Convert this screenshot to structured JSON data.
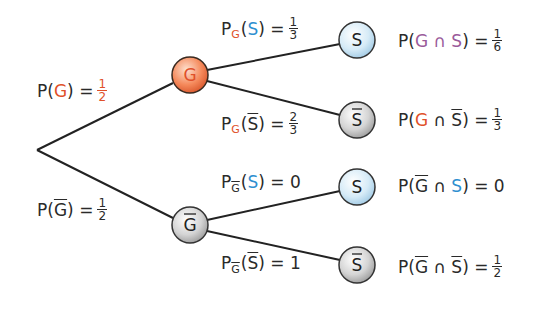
{
  "colors": {
    "g_accent": "#e0502a",
    "s_accent": "#2f8fd0",
    "intersection_accent": "#9a5a9a",
    "g_node_fill": "#f58a5c",
    "s_node_fill": "#cfe6f5",
    "neg_node_fill": "#cfcfcf",
    "line": "#222222"
  },
  "root": {
    "x": 37,
    "y": 150
  },
  "nodes": [
    {
      "id": "G",
      "label": "G",
      "negated": false,
      "x": 190,
      "y": 75,
      "style": "g"
    },
    {
      "id": "notG",
      "label": "G",
      "negated": true,
      "x": 190,
      "y": 225,
      "style": "neg"
    },
    {
      "id": "G_S",
      "label": "S",
      "negated": false,
      "x": 357,
      "y": 40,
      "style": "s"
    },
    {
      "id": "G_notS",
      "label": "S",
      "negated": true,
      "x": 357,
      "y": 120,
      "style": "neg"
    },
    {
      "id": "notG_S",
      "label": "S",
      "negated": false,
      "x": 357,
      "y": 187,
      "style": "s"
    },
    {
      "id": "notG_notS",
      "label": "S",
      "negated": true,
      "x": 357,
      "y": 265,
      "style": "neg"
    }
  ],
  "first_level": {
    "pG": {
      "text": "P(G) =",
      "num": "1",
      "den": "2"
    },
    "pNotG": {
      "text": "P(Ḡ) =",
      "num": "1",
      "den": "2"
    }
  },
  "conditional": {
    "pG_S": {
      "num": "1",
      "den": "3"
    },
    "pG_notS": {
      "num": "2",
      "den": "3"
    },
    "pNotG_S": {
      "value": "0"
    },
    "pNotG_notS": {
      "value": "1"
    }
  },
  "joint": {
    "G_and_S": {
      "num": "1",
      "den": "6"
    },
    "G_and_notS": {
      "num": "1",
      "den": "3"
    },
    "notG_and_S": {
      "value": "0"
    },
    "notG_and_notS": {
      "num": "1",
      "den": "2"
    }
  },
  "symbols": {
    "P": "P",
    "G": "G",
    "S": "S",
    "cap": "∩",
    "eq": "=",
    "lp": "(",
    "rp": ")"
  }
}
